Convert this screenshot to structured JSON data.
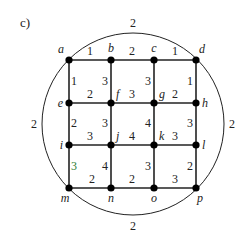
{
  "title": "c)",
  "colors": {
    "stroke": "#222222",
    "node": "#000000",
    "highlight_weight": "#2e7d32"
  },
  "circle": {
    "cx": 133,
    "cy": 124,
    "r": 91
  },
  "nodes": [
    {
      "id": "a",
      "x": 69,
      "y": 60,
      "lx": 64,
      "ly": 53,
      "anchor": "end"
    },
    {
      "id": "b",
      "x": 111,
      "y": 60,
      "lx": 111,
      "ly": 52,
      "anchor": "middle"
    },
    {
      "id": "c",
      "x": 154,
      "y": 60,
      "lx": 154,
      "ly": 52,
      "anchor": "middle"
    },
    {
      "id": "d",
      "x": 196,
      "y": 60,
      "lx": 199,
      "ly": 53,
      "anchor": "start"
    },
    {
      "id": "e",
      "x": 69,
      "y": 103,
      "lx": 63,
      "ly": 107,
      "anchor": "end"
    },
    {
      "id": "f",
      "x": 111,
      "y": 103,
      "lx": 116,
      "ly": 98,
      "anchor": "start"
    },
    {
      "id": "g",
      "x": 154,
      "y": 103,
      "lx": 159,
      "ly": 98,
      "anchor": "start"
    },
    {
      "id": "h",
      "x": 196,
      "y": 103,
      "lx": 202,
      "ly": 107,
      "anchor": "start"
    },
    {
      "id": "i",
      "x": 69,
      "y": 145,
      "lx": 63,
      "ly": 149,
      "anchor": "end"
    },
    {
      "id": "j",
      "x": 111,
      "y": 145,
      "lx": 116,
      "ly": 140,
      "anchor": "start"
    },
    {
      "id": "k",
      "x": 154,
      "y": 145,
      "lx": 159,
      "ly": 140,
      "anchor": "start"
    },
    {
      "id": "l",
      "x": 196,
      "y": 145,
      "lx": 202,
      "ly": 149,
      "anchor": "start"
    },
    {
      "id": "m",
      "x": 69,
      "y": 188,
      "lx": 65,
      "ly": 202,
      "anchor": "middle"
    },
    {
      "id": "n",
      "x": 111,
      "y": 188,
      "lx": 111,
      "ly": 202,
      "anchor": "middle"
    },
    {
      "id": "o",
      "x": 154,
      "y": 188,
      "lx": 154,
      "ly": 202,
      "anchor": "middle"
    },
    {
      "id": "p",
      "x": 196,
      "y": 188,
      "lx": 200,
      "ly": 202,
      "anchor": "middle"
    }
  ],
  "edges": [
    {
      "from": "a",
      "to": "b",
      "weight": "1",
      "wx": 90,
      "wy": 55
    },
    {
      "from": "b",
      "to": "c",
      "weight": "2",
      "wx": 132,
      "wy": 55
    },
    {
      "from": "c",
      "to": "d",
      "weight": "1",
      "wx": 175,
      "wy": 55
    },
    {
      "from": "e",
      "to": "f",
      "weight": "2",
      "wx": 90,
      "wy": 98
    },
    {
      "from": "f",
      "to": "g",
      "weight": "3",
      "wx": 132,
      "wy": 98
    },
    {
      "from": "g",
      "to": "h",
      "weight": "2",
      "wx": 175,
      "wy": 98
    },
    {
      "from": "i",
      "to": "j",
      "weight": "3",
      "wx": 90,
      "wy": 140
    },
    {
      "from": "j",
      "to": "k",
      "weight": "4",
      "wx": 132,
      "wy": 140
    },
    {
      "from": "k",
      "to": "l",
      "weight": "3",
      "wx": 175,
      "wy": 140
    },
    {
      "from": "m",
      "to": "n",
      "weight": "2",
      "wx": 92,
      "wy": 183
    },
    {
      "from": "n",
      "to": "o",
      "weight": "2",
      "wx": 132,
      "wy": 183
    },
    {
      "from": "o",
      "to": "p",
      "weight": "3",
      "wx": 175,
      "wy": 183
    },
    {
      "from": "a",
      "to": "e",
      "weight": "1",
      "wx": 74,
      "wy": 85
    },
    {
      "from": "e",
      "to": "i",
      "weight": "2",
      "wx": 74,
      "wy": 127
    },
    {
      "from": "i",
      "to": "m",
      "weight": "3",
      "wx": 74,
      "wy": 170,
      "highlight": true
    },
    {
      "from": "b",
      "to": "f",
      "weight": "3",
      "wx": 105,
      "wy": 85
    },
    {
      "from": "f",
      "to": "j",
      "weight": "3",
      "wx": 105,
      "wy": 127
    },
    {
      "from": "j",
      "to": "n",
      "weight": "4",
      "wx": 105,
      "wy": 170
    },
    {
      "from": "c",
      "to": "g",
      "weight": "3",
      "wx": 148,
      "wy": 85
    },
    {
      "from": "g",
      "to": "k",
      "weight": "4",
      "wx": 148,
      "wy": 127
    },
    {
      "from": "k",
      "to": "o",
      "weight": "3",
      "wx": 148,
      "wy": 170
    },
    {
      "from": "d",
      "to": "h",
      "weight": "1",
      "wx": 190,
      "wy": 85
    },
    {
      "from": "h",
      "to": "l",
      "weight": "3",
      "wx": 190,
      "wy": 127
    },
    {
      "from": "l",
      "to": "p",
      "weight": "2",
      "wx": 190,
      "wy": 170
    }
  ],
  "arcs": [
    {
      "name": "top",
      "from": "a",
      "to": "d",
      "weight": "2",
      "wx": 133,
      "wy": 27
    },
    {
      "name": "left",
      "from": "a",
      "to": "m",
      "weight": "2",
      "wx": 34,
      "wy": 128
    },
    {
      "name": "right",
      "from": "d",
      "to": "p",
      "weight": "2",
      "wx": 232,
      "wy": 128
    },
    {
      "name": "bottom",
      "from": "m",
      "to": "p",
      "weight": "2",
      "wx": 133,
      "wy": 230
    }
  ]
}
